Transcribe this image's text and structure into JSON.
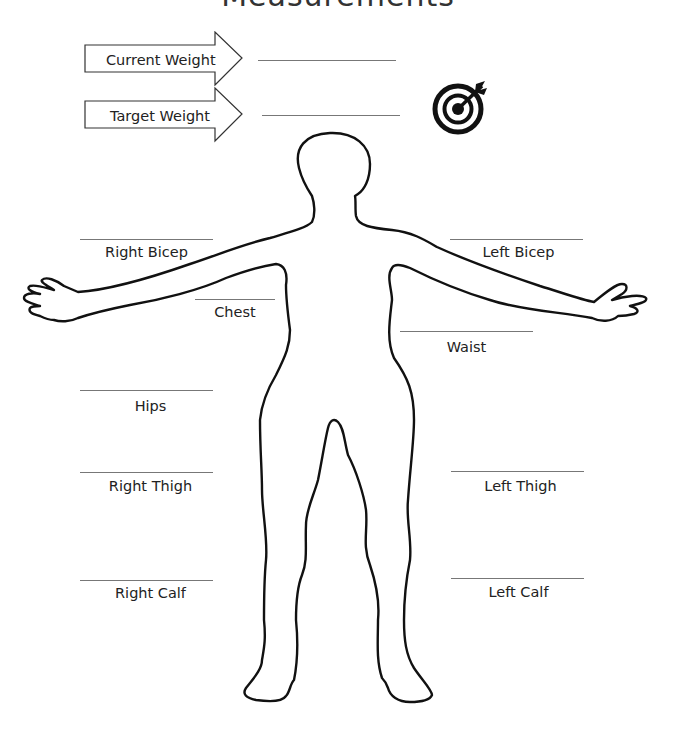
{
  "page": {
    "title": "Measurements"
  },
  "weights": [
    {
      "label": "Current Weight",
      "value": ""
    },
    {
      "label": "Target Weight",
      "value": ""
    }
  ],
  "icons": {
    "target": "target-bullseye-icon",
    "arrow": "arrow-right-icon",
    "body": "body-silhouette"
  },
  "measurements": {
    "right_bicep": {
      "label": "Right Bicep",
      "value": ""
    },
    "left_bicep": {
      "label": "Left Bicep",
      "value": ""
    },
    "chest": {
      "label": "Chest",
      "value": ""
    },
    "waist": {
      "label": "Waist",
      "value": ""
    },
    "hips": {
      "label": "Hips",
      "value": ""
    },
    "right_thigh": {
      "label": "Right Thigh",
      "value": ""
    },
    "left_thigh": {
      "label": "Left Thigh",
      "value": ""
    },
    "right_calf": {
      "label": "Right Calf",
      "value": ""
    },
    "left_calf": {
      "label": "Left Calf",
      "value": ""
    }
  },
  "colors": {
    "outline": "#111111",
    "line": "#777777",
    "text": "#222222"
  }
}
